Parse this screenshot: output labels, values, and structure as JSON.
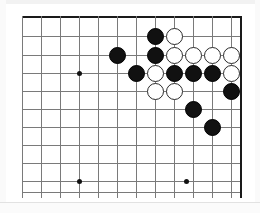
{
  "figure": {
    "kind": "go-board-diagram",
    "background_color": "#ffffff",
    "line_color": "#7a7a7a",
    "edge_line_color": "#1a1a1a",
    "black_stone_color": "#111111",
    "white_stone_color": "#ffffff",
    "white_stone_outline_color": "#2b2b2b"
  },
  "board": {
    "origin_x": 14,
    "origin_y": 8,
    "cell_size": 18.9,
    "stone_diameter": 17,
    "columns": 12,
    "rows": 10,
    "vertical_lines_x": [
      14,
      33,
      52,
      71,
      90,
      109,
      128,
      147,
      166,
      185,
      204,
      223,
      232
    ],
    "horizontal_lines_y": [
      8,
      28,
      47,
      65,
      83,
      101,
      119,
      137,
      155,
      173,
      184
    ],
    "top_edge_index": 0,
    "right_edge_index": 12,
    "star_points": [
      {
        "x": 71,
        "y": 65
      },
      {
        "x": 71,
        "y": 173
      },
      {
        "x": 178,
        "y": 173
      }
    ]
  },
  "stones": [
    {
      "color": "black",
      "x": 147,
      "y": 28,
      "label": "black-stone-r1-c8"
    },
    {
      "color": "white",
      "x": 166,
      "y": 28,
      "label": "white-stone-r1-c9"
    },
    {
      "color": "black",
      "x": 109,
      "y": 47,
      "label": "black-stone-r2-c6"
    },
    {
      "color": "black",
      "x": 147,
      "y": 47,
      "label": "black-stone-r2-c8"
    },
    {
      "color": "white",
      "x": 166,
      "y": 47,
      "label": "white-stone-r2-c9"
    },
    {
      "color": "white",
      "x": 185,
      "y": 47,
      "label": "white-stone-r2-c10"
    },
    {
      "color": "white",
      "x": 204,
      "y": 47,
      "label": "white-stone-r2-c11"
    },
    {
      "color": "white",
      "x": 223,
      "y": 47,
      "label": "white-stone-r2-c12"
    },
    {
      "color": "black",
      "x": 128,
      "y": 65,
      "label": "black-stone-r3-c7"
    },
    {
      "color": "white",
      "x": 147,
      "y": 65,
      "label": "white-stone-r3-c8"
    },
    {
      "color": "black",
      "x": 166,
      "y": 65,
      "label": "black-stone-r3-c9"
    },
    {
      "color": "black",
      "x": 185,
      "y": 65,
      "label": "black-stone-r3-c10"
    },
    {
      "color": "black",
      "x": 204,
      "y": 65,
      "label": "black-stone-r3-c11"
    },
    {
      "color": "white",
      "x": 223,
      "y": 65,
      "label": "white-stone-r3-c12"
    },
    {
      "color": "white",
      "x": 147,
      "y": 83,
      "label": "white-stone-r4-c8"
    },
    {
      "color": "white",
      "x": 166,
      "y": 83,
      "label": "white-stone-r4-c9"
    },
    {
      "color": "black",
      "x": 223,
      "y": 83,
      "label": "black-stone-r4-c12"
    },
    {
      "color": "black",
      "x": 185,
      "y": 101,
      "label": "black-stone-r5-c10"
    },
    {
      "color": "black",
      "x": 204,
      "y": 119,
      "label": "black-stone-r6-c11"
    }
  ]
}
